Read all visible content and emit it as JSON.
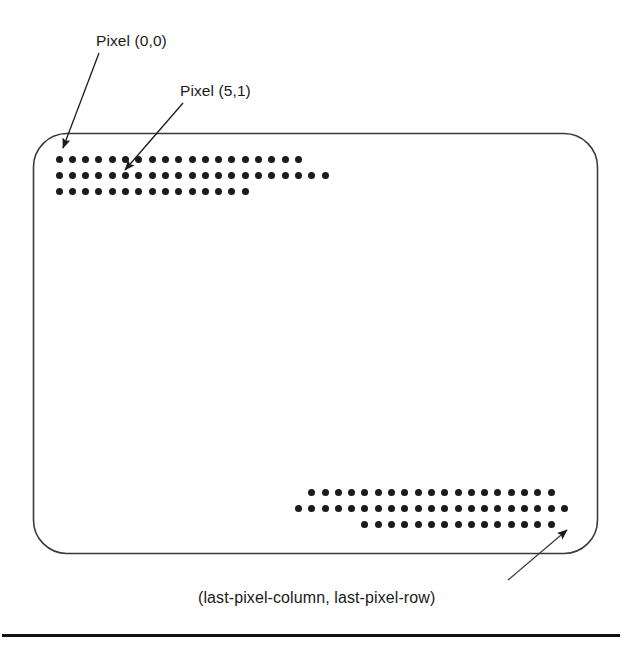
{
  "figure": {
    "background_color": "#ffffff",
    "ink_color": "#1b1b1b",
    "labels": {
      "top_left_callout": "Pixel (0,0)",
      "second_callout": "Pixel (5,1)",
      "bottom_caption": "(last-pixel-column, last-pixel-row)"
    },
    "screen_outline": {
      "shape": "rounded-rectangle",
      "x": 33,
      "y": 133,
      "width": 565,
      "height": 420,
      "corner_radius": 34,
      "stroke_color": "#3a3a3a",
      "stroke_width": 1.6
    },
    "leader_lines": [
      {
        "name": "arrow-to-pixel-0-0",
        "from_x": 98,
        "from_y": 52,
        "to_x": 62,
        "to_y": 150,
        "arrowhead": "filled-triangle"
      },
      {
        "name": "arrow-to-pixel-5-1",
        "from_x": 182,
        "from_y": 102,
        "to_x": 124,
        "to_y": 172,
        "arrowhead": "filled-triangle"
      },
      {
        "name": "arrow-to-last-pixel",
        "from_x": 510,
        "from_y": 578,
        "to_x": 566,
        "to_y": 530,
        "arrowhead": "filled-triangle"
      }
    ],
    "dot_grid": {
      "dot_diameter": 7,
      "column_spacing": 13.3,
      "row_spacing": 16,
      "dot_color": "#1b1b1b"
    },
    "top_left_block": {
      "name": "first-pixels-block",
      "origin_x": 59,
      "origin_y": 159,
      "rows": [
        {
          "start_col": 0,
          "count": 19
        },
        {
          "start_col": 0,
          "count": 21
        },
        {
          "start_col": 0,
          "count": 15
        }
      ]
    },
    "bottom_right_block": {
      "name": "last-pixels-block",
      "origin_x": 59,
      "origin_y": 492,
      "rows": [
        {
          "start_col": 19,
          "count": 19
        },
        {
          "start_col": 18,
          "count": 21
        },
        {
          "start_col": 23,
          "count": 15
        }
      ]
    },
    "baseline_rule": {
      "name": "page-bottom-rule",
      "x": 2,
      "y": 634,
      "width": 618,
      "height": 3,
      "color": "#111111"
    }
  }
}
